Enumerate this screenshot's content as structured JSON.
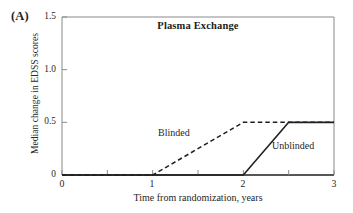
{
  "panel": {
    "label": "(A)"
  },
  "chart_data": {
    "type": "line",
    "title": "Plasma Exchange",
    "xlabel": "Time from randomization, years",
    "ylabel": "Median change in EDSS scores",
    "xlim": [
      0,
      3
    ],
    "ylim": [
      0,
      1.5
    ],
    "grid": false,
    "legend_position": "inline-annotation",
    "x_ticks": [
      0,
      1,
      2,
      3
    ],
    "x_tick_labels": [
      "0",
      "1",
      "2",
      "3"
    ],
    "x_minor_ticks": [
      0.5,
      1.5,
      2.5
    ],
    "y_ticks": [
      0,
      0.5,
      1.0,
      1.5
    ],
    "y_tick_labels": [
      "0",
      "0.5",
      "1.0",
      "1.5"
    ],
    "series": [
      {
        "name": "Blinded",
        "style": "dashed",
        "color": "#1f1f1f",
        "x": [
          0,
          1,
          2,
          3
        ],
        "values": [
          0,
          0,
          0.5,
          0.5
        ]
      },
      {
        "name": "Unblinded",
        "style": "solid",
        "color": "#1f1f1f",
        "x": [
          0,
          2,
          2.5,
          3
        ],
        "values": [
          0,
          0,
          0.5,
          0.5
        ]
      }
    ],
    "annotations": [
      {
        "text": "Blinded",
        "x": 1.05,
        "y": 0.46
      },
      {
        "text": "Unblinded",
        "x": 2.32,
        "y": 0.33
      }
    ]
  },
  "style": {
    "axis_color": "#8a8a8a",
    "line_color": "#1f1f1f",
    "background": "#ffffff"
  }
}
